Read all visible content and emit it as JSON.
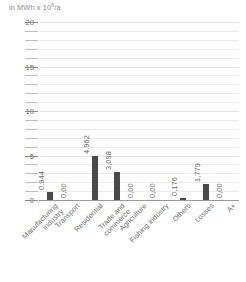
{
  "chart_data": {
    "type": "bar",
    "title": "",
    "subtitle": "",
    "axis_unit_prefix": "in MWh x 10",
    "axis_unit_exponent": "6",
    "axis_unit_suffix": "/a",
    "ylabel": "in MWh x 10⁶/a",
    "xlabel": "",
    "ylim": [
      0,
      20
    ],
    "ytick_step": 1,
    "ytick_labeled_step": 5,
    "yticks": [
      0,
      1,
      2,
      3,
      4,
      5,
      6,
      7,
      8,
      9,
      10,
      11,
      12,
      13,
      14,
      15,
      16,
      17,
      18,
      19,
      20
    ],
    "ytick_labels": [
      "0",
      "5",
      "10",
      "15",
      "20"
    ],
    "ytick_labeled_values": [
      0,
      5,
      10,
      15,
      20
    ],
    "grid": true,
    "legend": false,
    "categories": [
      "Manufacturing\nindustry",
      "Transport",
      "Residential",
      "Trade and\ncommerce",
      "Agriculture",
      "Fishing industry",
      "Others",
      "Losses",
      "A+"
    ],
    "values": [
      0.944,
      0.0,
      4.962,
      3.098,
      0.0,
      0.0,
      0.176,
      1.779,
      0.0
    ],
    "value_labels": [
      "0.944",
      "0,00",
      "4.962",
      "3,098",
      "0,00",
      "0,00",
      "0,176",
      "1,779",
      "0,00"
    ],
    "bar_color": "#4a4a4a",
    "grid_color": "#ececec",
    "axis_color": "#9a9a9a",
    "text_color": "#6f6f6f"
  }
}
